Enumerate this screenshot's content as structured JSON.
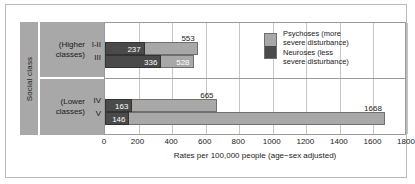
{
  "axis_label": "Social class",
  "groups": [
    {
      "name": "(Higher\nclasses)",
      "rows": [
        "I-II",
        "III"
      ]
    },
    {
      "name": "(Lower\nclasses)",
      "rows": [
        "IV",
        "V"
      ]
    }
  ],
  "legend": {
    "psychoses": "Psychoses (more\nsevere disturbance)",
    "neuroses": "Neuroses (less\nsevere disturbance)"
  },
  "colors": {
    "psychoses": "#a8a8a8",
    "neuroses": "#4a4a4a",
    "panel": "#a8a8a8"
  },
  "chart_data": {
    "type": "bar",
    "title": "",
    "xlabel": "Rates per 100,000 people (age−sex adjusted)",
    "ylabel": "Social class",
    "orientation": "horizontal",
    "xlim": [
      0,
      1800
    ],
    "xticks": [
      0,
      200,
      400,
      600,
      800,
      1000,
      1200,
      1400,
      1600,
      1800
    ],
    "grid": true,
    "legend_position": "inside-top-right",
    "categories": [
      "I-II",
      "III",
      "IV",
      "V"
    ],
    "series": [
      {
        "name": "Psychoses (more severe disturbance)",
        "values": [
          553,
          528,
          665,
          1668
        ]
      },
      {
        "name": "Neuroses (less severe disturbance)",
        "values": [
          237,
          336,
          163,
          146
        ]
      }
    ],
    "bars": [
      {
        "category": "I-II",
        "series": "Psychoses (more severe disturbance)",
        "value": 553,
        "label": "553",
        "label_inside": false
      },
      {
        "category": "I-II",
        "series": "Neuroses (less severe disturbance)",
        "value": 237,
        "label": "237",
        "label_inside": true
      },
      {
        "category": "III",
        "series": "Psychoses (more severe disturbance)",
        "value": 528,
        "label": "528",
        "label_inside": true
      },
      {
        "category": "III",
        "series": "Neuroses (less severe disturbance)",
        "value": 336,
        "label": "336",
        "label_inside": true
      },
      {
        "category": "IV",
        "series": "Psychoses (more severe disturbance)",
        "value": 665,
        "label": "665",
        "label_inside": false
      },
      {
        "category": "IV",
        "series": "Neuroses (less severe disturbance)",
        "value": 163,
        "label": "163",
        "label_inside": true
      },
      {
        "category": "V",
        "series": "Psychoses (more severe disturbance)",
        "value": 1668,
        "label": "1668",
        "label_inside": false
      },
      {
        "category": "V",
        "series": "Neuroses (less severe disturbance)",
        "value": 146,
        "label": "146",
        "label_inside": true
      }
    ]
  }
}
